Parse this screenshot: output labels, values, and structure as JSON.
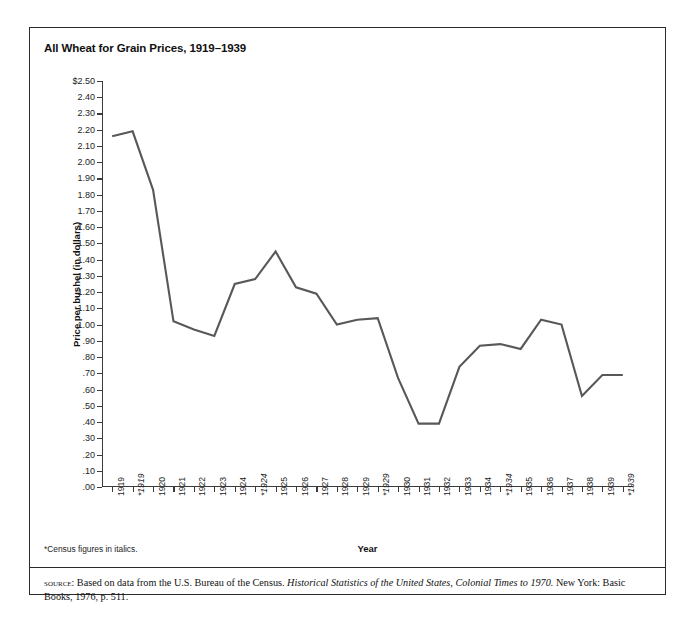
{
  "figure": {
    "title": "All Wheat for Grain Prices, 1919–1939",
    "footnote": "*Census figures in italics.",
    "source": {
      "label": "source:",
      "text_before_title": " Based on data from the U.S. Bureau of the Census. ",
      "title": "Historical Statistics of the United States, Colonial Times to 1970.",
      "text_after_title": "  New York: Basic Books, 1976, p. 511."
    },
    "colors": {
      "line": "#58585a",
      "axis": "#3b3b3b",
      "border": "#2b2b2b",
      "text": "#111111",
      "background": "#ffffff"
    }
  },
  "chart_data": {
    "type": "line",
    "title": "All Wheat for Grain Prices, 1919–1939",
    "xlabel": "Year",
    "ylabel": "Price per bushel (in dollars)",
    "ylim": [
      0,
      2.5
    ],
    "grid": false,
    "legend": "none",
    "ytick_labels": [
      "$2.50",
      "2.40",
      "2.30",
      "2.20",
      "2.10",
      "2.00",
      "1.90",
      "1.80",
      "1.70",
      "1.60",
      "1.50",
      "1.40",
      "1.30",
      "1.20",
      "1.10",
      "1.00",
      ".90",
      ".80",
      ".70",
      ".60",
      ".50",
      ".40",
      ".30",
      ".20",
      ".10",
      ".00"
    ],
    "ytick_values": [
      2.5,
      2.4,
      2.3,
      2.2,
      2.1,
      2.0,
      1.9,
      1.8,
      1.7,
      1.6,
      1.5,
      1.4,
      1.3,
      1.2,
      1.1,
      1.0,
      0.9,
      0.8,
      0.7,
      0.6,
      0.5,
      0.4,
      0.3,
      0.2,
      0.1,
      0.0
    ],
    "categories": [
      "1919",
      "*1919",
      "1920",
      "1921",
      "1922",
      "1923",
      "1924",
      "*1924",
      "1925",
      "1926",
      "1927",
      "1928",
      "1929",
      "*1929",
      "1930",
      "1931",
      "1932",
      "1933",
      "1934",
      "*1934",
      "1935",
      "1936",
      "1937",
      "1938",
      "1939",
      "*1939"
    ],
    "categories_italic": [
      false,
      true,
      false,
      false,
      false,
      false,
      false,
      true,
      false,
      false,
      false,
      false,
      false,
      true,
      false,
      false,
      false,
      false,
      false,
      true,
      false,
      false,
      false,
      false,
      false,
      true
    ],
    "values": [
      2.16,
      2.19,
      1.83,
      1.02,
      0.97,
      0.93,
      1.25,
      1.28,
      1.45,
      1.23,
      1.19,
      1.0,
      1.03,
      1.04,
      0.67,
      0.39,
      0.39,
      0.74,
      0.87,
      0.88,
      0.85,
      1.03,
      1.0,
      0.56,
      0.69,
      0.69
    ]
  }
}
